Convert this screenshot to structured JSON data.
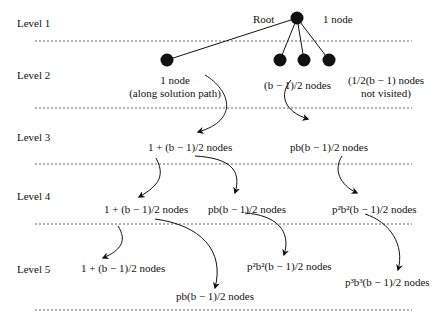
{
  "levels": [
    {
      "label": "Level 1"
    },
    {
      "label": "Level 2"
    },
    {
      "label": "Level 3"
    },
    {
      "label": "Level 4"
    },
    {
      "label": "Level 5"
    }
  ],
  "root": {
    "label": "Root",
    "count": "1 node"
  },
  "level2": {
    "left": {
      "line1": "1 node",
      "line2": "(along solution path)"
    },
    "middle": {
      "text": "(b − 1)/2 nodes"
    },
    "right": {
      "line1": "(1/2(b − 1) nodes",
      "line2": "not visited)"
    }
  },
  "level3": {
    "left": "1 + (b − 1)/2 nodes",
    "right": "pb(b − 1)/2 nodes"
  },
  "level4": {
    "left": "1 + (b − 1)/2 nodes",
    "middle": "pb(b − 1)/2 nodes",
    "right": "p²b²(b − 1)/2 nodes"
  },
  "level5": {
    "left": "1 + (b − 1)/2 nodes",
    "low": "pb(b − 1)/2 nodes",
    "middle": "p²b²(b − 1)/2 nodes",
    "right": "p³b³(b − 1)/2 nodes"
  },
  "colors": {
    "ink": "#111111",
    "dotted": "#555555",
    "background": "#ffffff"
  }
}
